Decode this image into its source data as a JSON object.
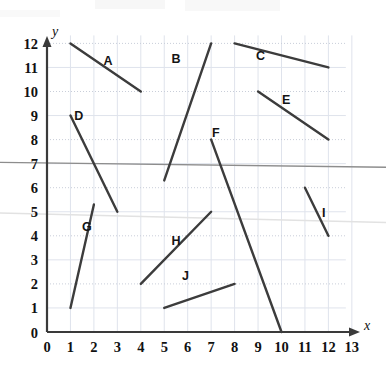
{
  "chart_data": {
    "type": "line",
    "title": "",
    "subtitle": "",
    "xlabel": "x",
    "ylabel": "y",
    "xlim": [
      0,
      13
    ],
    "ylim": [
      0,
      12
    ],
    "grid": true,
    "legend": "none",
    "x_ticks": [
      "0",
      "1",
      "2",
      "3",
      "4",
      "5",
      "6",
      "7",
      "8",
      "9",
      "10",
      "11",
      "12",
      "13"
    ],
    "y_ticks": [
      "0",
      "1",
      "2",
      "3",
      "4",
      "5",
      "6",
      "7",
      "8",
      "9",
      "10",
      "11",
      "12"
    ],
    "series": [
      {
        "name": "A",
        "x": [
          1,
          4
        ],
        "y": [
          12,
          10
        ],
        "label_x": 2.6,
        "label_y": 11.1
      },
      {
        "name": "B",
        "x": [
          5,
          7
        ],
        "y": [
          6.3,
          12
        ],
        "label_x": 5.5,
        "label_y": 11.2
      },
      {
        "name": "C",
        "x": [
          8,
          12
        ],
        "y": [
          12,
          11
        ],
        "label_x": 9.1,
        "label_y": 11.3
      },
      {
        "name": "D",
        "x": [
          1,
          3
        ],
        "y": [
          9,
          5
        ],
        "label_x": 1.35,
        "label_y": 8.8
      },
      {
        "name": "E",
        "x": [
          9,
          12
        ],
        "y": [
          10,
          8
        ],
        "label_x": 10.2,
        "label_y": 9.5
      },
      {
        "name": "F",
        "x": [
          7,
          10
        ],
        "y": [
          8,
          0
        ],
        "label_x": 7.2,
        "label_y": 8.1
      },
      {
        "name": "G",
        "x": [
          1,
          2
        ],
        "y": [
          1,
          5.3
        ],
        "label_x": 1.7,
        "label_y": 4.2
      },
      {
        "name": "H",
        "x": [
          4,
          7
        ],
        "y": [
          2,
          5
        ],
        "label_x": 5.5,
        "label_y": 3.6
      },
      {
        "name": "I",
        "x": [
          11,
          12
        ],
        "y": [
          6,
          4
        ],
        "label_x": 11.8,
        "label_y": 4.8
      },
      {
        "name": "J",
        "x": [
          5,
          8
        ],
        "y": [
          1,
          2
        ],
        "label_x": 5.9,
        "label_y": 2.15
      }
    ],
    "annotations": [
      {
        "name": "scan-artifact-line-upper",
        "y_left": 7.05,
        "y_right": 6.85
      },
      {
        "name": "scan-artifact-line-lower",
        "y_left": 4.95,
        "y_right": 4.55
      }
    ],
    "colors": {
      "segment": "#3c3c3c",
      "axis": "#3a3a3a",
      "grid": "#dfe3ec",
      "artifact": "#8d8d8d",
      "background": "#ffffff"
    }
  }
}
